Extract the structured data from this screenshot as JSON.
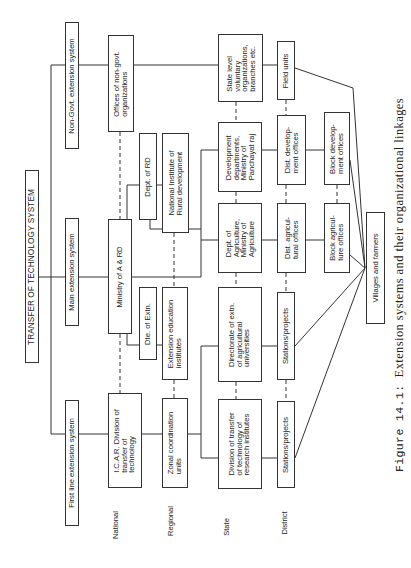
{
  "diagram": {
    "title": "TRANSFER OF TECHNOLOGY SYSTEM",
    "systems": [
      {
        "id": "non_govt",
        "label": "Non-Govt. extension system"
      },
      {
        "id": "main",
        "label": "Main extension system"
      },
      {
        "id": "first_line",
        "label": "First line extension system"
      }
    ],
    "levels": {
      "national": "National",
      "regional": "Regional",
      "state": "State",
      "district": "District"
    },
    "nodes": {
      "offices_ngo": "Offices of non-govt.\norganizations",
      "ministry": "Ministry of A & RD",
      "icar": "I.C.A.R. Division of\ntransfer of\ntechnology",
      "dept_rd": "Dept. of RD",
      "nird": "National Institute of\nRural development",
      "dte_extn": "Dte. of Extn.",
      "ext_edu": "Extension education\ninstitutes",
      "zonal": "Zonal coordination\nunits",
      "state_vol": "State level\nvoluntary\norganizations,\nbranches etc.",
      "dev_depts": "Development\ndepartments,\nMinistry of\nPanchayat raj",
      "dept_agri": "Dept. of\nAgriculture,\nMinistry of\nAgriculture",
      "dir_extn": "Directorate of extn.\nof agricultural\nuniversities",
      "div_research": "Division of transfer\nof technology of\nresearch institutes",
      "field_units": "Field units",
      "dist_dev": "Dist. develop-\nment offices",
      "dist_agri": "Dist. agricul-\ntural offices",
      "stations_univ": "Stations/projects",
      "stations_res": "Stations/projects",
      "block_dev": "Block develop-\nment offices",
      "block_agri": "Block agricul-\nture offices",
      "villages": "Villages and farmers"
    },
    "edges": {
      "solid": [
        [
          "title",
          "non_govt"
        ],
        [
          "title",
          "main"
        ],
        [
          "title",
          "first_line"
        ],
        [
          "non_govt",
          "offices_ngo"
        ],
        [
          "main",
          "ministry"
        ],
        [
          "first_line",
          "icar"
        ],
        [
          "offices_ngo",
          "state_vol"
        ],
        [
          "state_vol",
          "field_units"
        ],
        [
          "ministry",
          "dept_rd"
        ],
        [
          "ministry",
          "dte_extn"
        ],
        [
          "ministry",
          "dev_depts"
        ],
        [
          "ministry",
          "dept_agri"
        ],
        [
          "dept_rd",
          "nird"
        ],
        [
          "dte_extn",
          "ext_edu"
        ],
        [
          "icar",
          "zonal"
        ],
        [
          "zonal",
          "div_research"
        ],
        [
          "zonal",
          "dir_extn"
        ],
        [
          "dev_depts",
          "dist_dev"
        ],
        [
          "dist_dev",
          "block_dev"
        ],
        [
          "dept_agri",
          "dist_agri"
        ],
        [
          "dist_agri",
          "block_agri"
        ],
        [
          "dir_extn",
          "stations_univ"
        ],
        [
          "div_research",
          "stations_res"
        ],
        [
          "field_units",
          "villages"
        ],
        [
          "block_dev",
          "villages"
        ],
        [
          "block_agri",
          "villages"
        ],
        [
          "stations_univ",
          "villages"
        ],
        [
          "stations_res",
          "villages"
        ]
      ],
      "dashed": [
        [
          "offices_ngo",
          "ministry"
        ],
        [
          "ministry",
          "icar"
        ],
        [
          "nird",
          "ext_edu"
        ],
        [
          "ext_edu",
          "zonal"
        ],
        [
          "state_vol",
          "dev_depts"
        ],
        [
          "dev_depts",
          "dept_agri"
        ],
        [
          "dept_agri",
          "dir_extn"
        ],
        [
          "dir_extn",
          "div_research"
        ],
        [
          "field_units",
          "dist_dev"
        ],
        [
          "dist_dev",
          "dist_agri"
        ],
        [
          "dist_agri",
          "stations_univ"
        ],
        [
          "stations_univ",
          "stations_res"
        ],
        [
          "block_dev",
          "block_agri"
        ]
      ]
    }
  },
  "caption": {
    "figure": "Figure 14.1:",
    "text": "Extension systems and their organizational linkages"
  }
}
